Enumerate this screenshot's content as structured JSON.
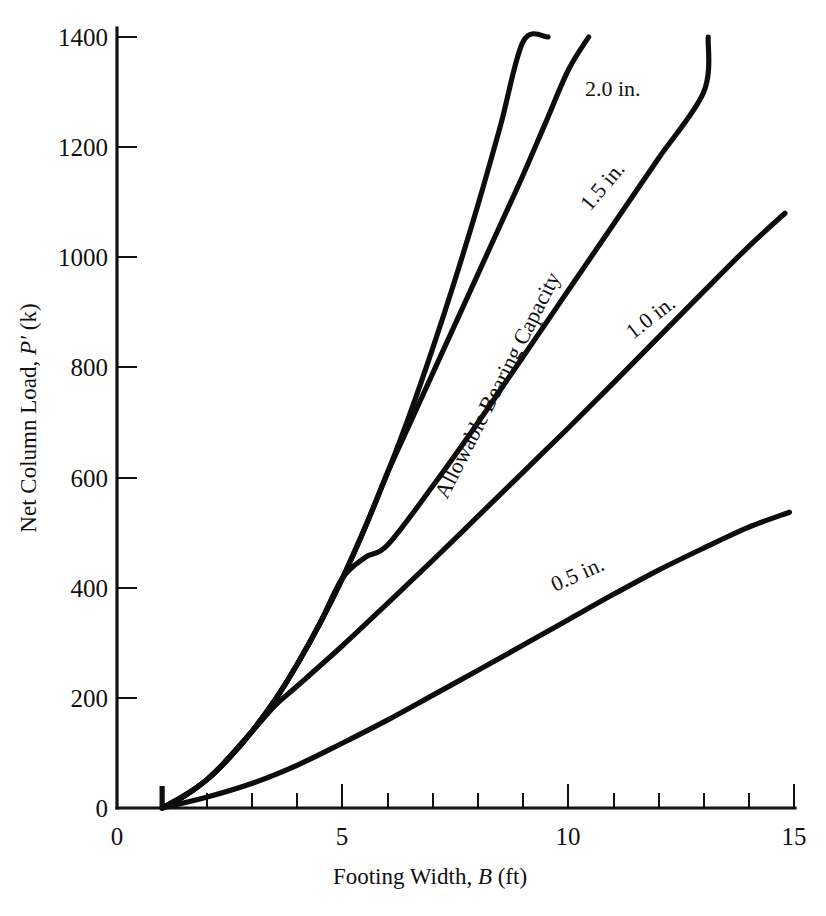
{
  "chart_data": {
    "type": "line",
    "title": "",
    "xlabel": "Footing Width, B (ft)",
    "ylabel": "Net Column Load, P' (k)",
    "xlim": [
      0,
      15
    ],
    "ylim": [
      0,
      1500
    ],
    "grid": false,
    "legend_position": "inline-curve-labels",
    "x_ticks_major": [
      0,
      5,
      10,
      15
    ],
    "x_tick_labels": [
      "0",
      "5",
      "10",
      "15"
    ],
    "x_ticks_minor": [
      1,
      2,
      3,
      4,
      6,
      7,
      8,
      9,
      11,
      12,
      13,
      14
    ],
    "y_ticks": [
      0,
      200,
      400,
      600,
      800,
      1000,
      1200,
      1400
    ],
    "y_tick_labels": [
      "0",
      "200",
      "400",
      "600",
      "800",
      "1000",
      "1200",
      "1400"
    ],
    "series": [
      {
        "name": "Allowable Bearing Capacity",
        "label": "Allowable Bearing Capacity",
        "x": [
          1.0,
          1.5,
          2.0,
          2.5,
          3.0,
          3.5,
          4.0,
          4.5,
          5.0,
          5.5,
          6.0,
          6.5,
          7.0,
          7.5,
          8.0,
          8.5,
          9.0,
          9.55
        ],
        "y": [
          0,
          22,
          52,
          92,
          140,
          196,
          262,
          336,
          418,
          510,
          610,
          718,
          836,
          962,
          1096,
          1240,
          1392,
          1400
        ]
      },
      {
        "name": "2.0 in.",
        "label": "2.0 in.",
        "x": [
          1.0,
          1.5,
          2.0,
          2.5,
          3.0,
          3.5,
          4.0,
          4.5,
          5.0,
          5.5,
          6.0,
          6.5,
          7.0,
          7.5,
          8.0,
          8.5,
          9.0,
          9.5,
          10.0,
          10.45
        ],
        "y": [
          0,
          22,
          52,
          92,
          140,
          196,
          262,
          336,
          418,
          510,
          610,
          700,
          790,
          880,
          970,
          1060,
          1150,
          1245,
          1340,
          1400
        ]
      },
      {
        "name": "1.5 in.",
        "label": "1.5 in.",
        "x": [
          1.0,
          1.5,
          2.0,
          2.5,
          3.0,
          3.5,
          4.0,
          4.5,
          5.0,
          5.5,
          6.0,
          7.0,
          8.0,
          9.0,
          10.0,
          11.0,
          12.0,
          13.0,
          13.1
        ],
        "y": [
          0,
          22,
          52,
          92,
          140,
          196,
          262,
          336,
          418,
          455,
          478,
          585,
          700,
          820,
          940,
          1060,
          1180,
          1300,
          1400
        ]
      },
      {
        "name": "1.0 in.",
        "label": "1.0 in.",
        "x": [
          1.0,
          2.0,
          3.0,
          3.5,
          4.0,
          5.0,
          6.0,
          7.0,
          8.0,
          9.0,
          10.0,
          11.0,
          12.0,
          13.0,
          14.0,
          14.8
        ],
        "y": [
          0,
          52,
          140,
          186,
          222,
          295,
          372,
          450,
          530,
          610,
          690,
          772,
          855,
          938,
          1020,
          1080
        ]
      },
      {
        "name": "0.5 in.",
        "label": "0.5 in.",
        "x": [
          1.0,
          2.0,
          3.0,
          4.0,
          5.0,
          6.0,
          7.0,
          8.0,
          9.0,
          10.0,
          11.0,
          12.0,
          13.0,
          14.0,
          14.9
        ],
        "y": [
          0,
          20,
          45,
          78,
          118,
          160,
          205,
          250,
          296,
          342,
          388,
          432,
          472,
          510,
          537
        ]
      }
    ],
    "annotations": [
      {
        "text": "Allowable Bearing Capacity",
        "x": 6.3,
        "y": 900
      },
      {
        "text": "2.0 in.",
        "x": 9.1,
        "y": 1330
      },
      {
        "text": "1.5 in.",
        "x": 9.0,
        "y": 1130
      },
      {
        "text": "1.0 in.",
        "x": 10.1,
        "y": 860
      },
      {
        "text": "0.5 in.",
        "x": 10.0,
        "y": 400
      }
    ]
  },
  "figure": {
    "axis_color": "#111111",
    "curve_color": "#0d0d0d",
    "background": "#ffffff"
  },
  "labels": {
    "x_axis_title_prefix": "Footing Width, ",
    "x_axis_title_var": "B",
    "x_axis_title_suffix": " (ft)",
    "y_axis_title_prefix": "Net Column Load, ",
    "y_axis_title_var": "P",
    "y_axis_title_prime": "′",
    "y_axis_title_suffix": " (k)"
  }
}
